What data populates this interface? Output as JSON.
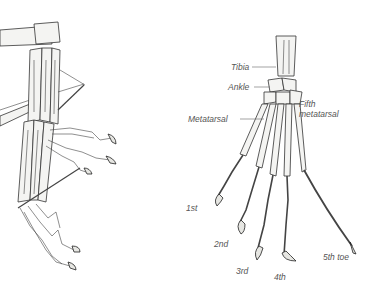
{
  "figure": {
    "left_panel": {
      "description": "Skeletal foot viewed from side, toes curled in grasping posture"
    },
    "right_panel": {
      "labels": {
        "tibia": "Tibia",
        "ankle": "Ankle",
        "metatarsal": "Metatarsal",
        "fifth_metatarsal_line1": "Fifth",
        "fifth_metatarsal_line2": "metatarsal",
        "toe_1": "1st",
        "toe_2": "2nd",
        "toe_3": "3rd",
        "toe_4": "4th",
        "toe_5": "5th toe"
      }
    }
  }
}
